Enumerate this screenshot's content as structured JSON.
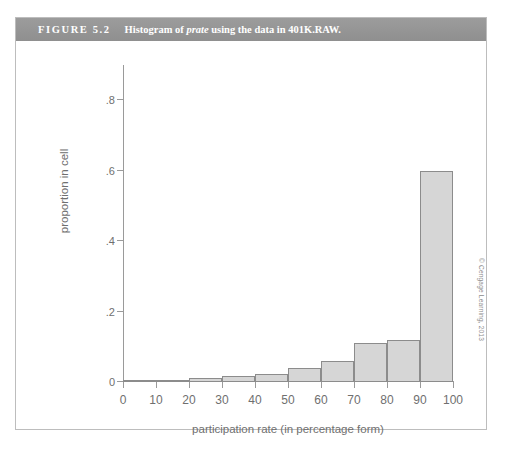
{
  "page_bleed_text": "",
  "figure": {
    "label": "FIGURE 5.2",
    "caption_before": "Histogram of ",
    "caption_italic": "prate",
    "caption_after": " using the data in 401K.RAW.",
    "header_color": "#949494"
  },
  "credit": "© Cengage Learning, 2013",
  "chart_data": {
    "type": "bar",
    "title": "Histogram of prate using the data in 401K.RAW.",
    "xlabel": "participation rate (in percentage form)",
    "ylabel": "proportion in cell",
    "xlim": [
      0,
      100
    ],
    "ylim": [
      0,
      0.9
    ],
    "grid": false,
    "legend": null,
    "bar_fill": "#d6d6d6",
    "bar_edge": "#8c8c8c",
    "xticks": [
      0,
      10,
      20,
      30,
      40,
      50,
      60,
      70,
      80,
      90,
      100
    ],
    "xtick_labels": [
      "0",
      "10",
      "20",
      "30",
      "40",
      "50",
      "60",
      "70",
      "80",
      "90",
      "100"
    ],
    "yticks": [
      0,
      0.2,
      0.4,
      0.6,
      0.8
    ],
    "ytick_labels": [
      "0",
      ".2",
      ".4",
      ".6",
      ".8"
    ],
    "bin_edges": [
      0,
      10,
      20,
      30,
      40,
      50,
      60,
      70,
      80,
      90,
      100
    ],
    "categories": [
      "0-10",
      "10-20",
      "20-30",
      "30-40",
      "40-50",
      "50-60",
      "60-70",
      "70-80",
      "80-90",
      "90-100"
    ],
    "values": [
      0.0,
      0.0,
      0.012,
      0.018,
      0.022,
      0.04,
      0.06,
      0.11,
      0.12,
      0.6
    ]
  }
}
